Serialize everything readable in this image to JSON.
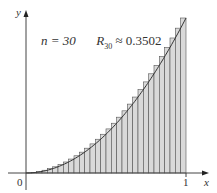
{
  "chart_data": {
    "type": "bar",
    "title": "",
    "annotation": {
      "n_label": "n = 30",
      "r_symbol": "R",
      "r_sub": "30",
      "r_value": "≈ 0.3502"
    },
    "function": "x^2",
    "n": 30,
    "method": "right endpoint Riemann sum",
    "approx_value": 0.3502,
    "xlabel": "x",
    "ylabel": "y",
    "x_ticks": [
      "0",
      "1"
    ],
    "xlim": [
      0,
      1
    ],
    "ylim": [
      0,
      1
    ],
    "grid": false,
    "legend": null,
    "colors": {
      "bar_fill": "#d9d9d9",
      "bar_stroke": "#555555",
      "curve": "#333333",
      "axis": "#444444"
    }
  },
  "labels": {
    "y_axis": "y",
    "x_axis": "x",
    "origin": "0",
    "x_one": "1"
  }
}
